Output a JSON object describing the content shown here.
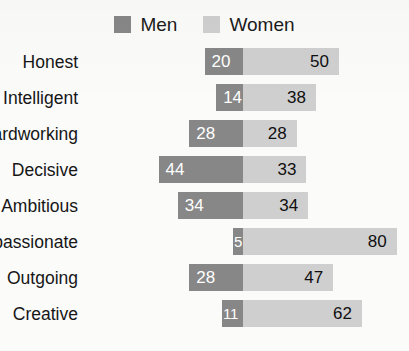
{
  "chart_data": {
    "type": "bar",
    "subtype": "diverging-horizontal-bar",
    "title": "",
    "xlabel": "",
    "ylabel": "",
    "grid": false,
    "legend_position": "top-center",
    "axis_note": "Men bars extend left from a shared center axis; Women bars extend right.",
    "categories": [
      "Honest",
      "Intelligent",
      "Hardworking",
      "Decisive",
      "Ambitious",
      "Compassionate",
      "Outgoing",
      "Creative"
    ],
    "series": [
      {
        "name": "Men",
        "color": "#878787",
        "direction": "left",
        "values": [
          20,
          14,
          28,
          44,
          34,
          5,
          28,
          11
        ]
      },
      {
        "name": "Women",
        "color": "#cfcfcf",
        "direction": "right",
        "values": [
          50,
          38,
          28,
          33,
          34,
          80,
          47,
          62
        ]
      }
    ],
    "value_max": 80
  },
  "legend": {
    "items": [
      {
        "label": "Men",
        "color": "#878787"
      },
      {
        "label": "Women",
        "color": "#cfcfcf"
      }
    ]
  },
  "colors": {
    "men": "#878787",
    "women": "#cfcfcf",
    "background": "#fbfbfa",
    "text": "#161616",
    "value_on_dark": "#ffffff",
    "value_on_light": "#101010"
  }
}
